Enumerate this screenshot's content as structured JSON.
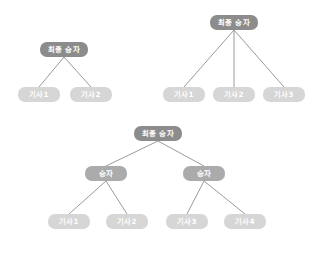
{
  "diagram": {
    "background_color": "#ffffff",
    "colors": {
      "root_node": "#8c8c8c",
      "mid_node": "#ababab",
      "leaf_node": "#d6d6d6",
      "edge_line": "#8f8f8f",
      "node_text": "#ffffff"
    },
    "labels": {
      "final_winner": "최종 승자",
      "winner": "승자",
      "article_1": "기사1",
      "article_2": "기사2",
      "article_3": "기사3",
      "article_4": "기사4"
    },
    "trees": [
      {
        "id": "tree-two-leaf",
        "name": "two-candidate-bracket",
        "nodes": [
          {
            "id": "t1-root",
            "role": "root",
            "label": "최종 승자",
            "x": 40,
            "y": 42,
            "w": 48,
            "h": 15
          },
          {
            "id": "t1-leaf-1",
            "role": "leaf",
            "label": "기사1",
            "x": 18,
            "y": 87,
            "w": 42,
            "h": 15
          },
          {
            "id": "t1-leaf-2",
            "role": "leaf",
            "label": "기사2",
            "x": 70,
            "y": 87,
            "w": 42,
            "h": 15
          }
        ],
        "edges": [
          {
            "from": "t1-root",
            "to": "t1-leaf-1"
          },
          {
            "from": "t1-root",
            "to": "t1-leaf-2"
          }
        ]
      },
      {
        "id": "tree-three-leaf",
        "name": "three-candidate-bracket",
        "nodes": [
          {
            "id": "t2-root",
            "role": "root",
            "label": "최종 승자",
            "x": 210,
            "y": 15,
            "w": 48,
            "h": 15
          },
          {
            "id": "t2-leaf-1",
            "role": "leaf",
            "label": "기사1",
            "x": 163,
            "y": 87,
            "w": 42,
            "h": 15
          },
          {
            "id": "t2-leaf-2",
            "role": "leaf",
            "label": "기사2",
            "x": 213,
            "y": 87,
            "w": 42,
            "h": 15
          },
          {
            "id": "t2-leaf-3",
            "role": "leaf",
            "label": "기사3",
            "x": 263,
            "y": 87,
            "w": 42,
            "h": 15
          }
        ],
        "edges": [
          {
            "from": "t2-root",
            "to": "t2-leaf-1"
          },
          {
            "from": "t2-root",
            "to": "t2-leaf-2"
          },
          {
            "from": "t2-root",
            "to": "t2-leaf-3"
          }
        ]
      },
      {
        "id": "tree-four-leaf",
        "name": "four-candidate-bracket",
        "nodes": [
          {
            "id": "t3-root",
            "role": "root",
            "label": "최종 승자",
            "x": 134,
            "y": 126,
            "w": 48,
            "h": 15
          },
          {
            "id": "t3-mid-left",
            "role": "mid",
            "label": "승자",
            "x": 85,
            "y": 166,
            "w": 42,
            "h": 15
          },
          {
            "id": "t3-mid-right",
            "role": "mid",
            "label": "승자",
            "x": 183,
            "y": 166,
            "w": 42,
            "h": 15
          },
          {
            "id": "t3-leaf-1",
            "role": "leaf",
            "label": "기사1",
            "x": 48,
            "y": 214,
            "w": 42,
            "h": 15
          },
          {
            "id": "t3-leaf-2",
            "role": "leaf",
            "label": "기사2",
            "x": 106,
            "y": 214,
            "w": 42,
            "h": 15
          },
          {
            "id": "t3-leaf-3",
            "role": "leaf",
            "label": "기사3",
            "x": 166,
            "y": 214,
            "w": 42,
            "h": 15
          },
          {
            "id": "t3-leaf-4",
            "role": "leaf",
            "label": "기사4",
            "x": 224,
            "y": 214,
            "w": 42,
            "h": 15
          }
        ],
        "edges": [
          {
            "from": "t3-root",
            "to": "t3-mid-left"
          },
          {
            "from": "t3-root",
            "to": "t3-mid-right"
          },
          {
            "from": "t3-mid-left",
            "to": "t3-leaf-1"
          },
          {
            "from": "t3-mid-left",
            "to": "t3-leaf-2"
          },
          {
            "from": "t3-mid-right",
            "to": "t3-leaf-3"
          },
          {
            "from": "t3-mid-right",
            "to": "t3-leaf-4"
          }
        ]
      }
    ]
  }
}
